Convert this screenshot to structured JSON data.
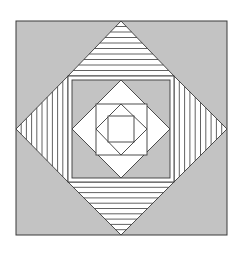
{
  "colors": {
    "background": "#ffffff",
    "gray_fill": "#c3c3c3",
    "white_fill": "#ffffff",
    "stroke": "#3a3a3a"
  },
  "geometry": {
    "outer_square": [
      16,
      21,
      227,
      235
    ],
    "center": [
      121,
      128
    ],
    "frame_outer": [
      68,
      76,
      174,
      182
    ],
    "frame_inner": [
      72,
      80,
      170,
      178
    ],
    "white_diamond": [
      [
        121,
        80
      ],
      [
        170,
        129
      ],
      [
        121,
        178
      ],
      [
        72,
        129
      ]
    ],
    "inner_square": [
      96,
      104,
      147,
      155
    ],
    "inner_diamond": [
      [
        121,
        104
      ],
      [
        147,
        129
      ],
      [
        121,
        155
      ],
      [
        96,
        129
      ]
    ],
    "innermost_square": [
      108,
      116,
      134,
      142
    ],
    "stripe_count": 10
  }
}
